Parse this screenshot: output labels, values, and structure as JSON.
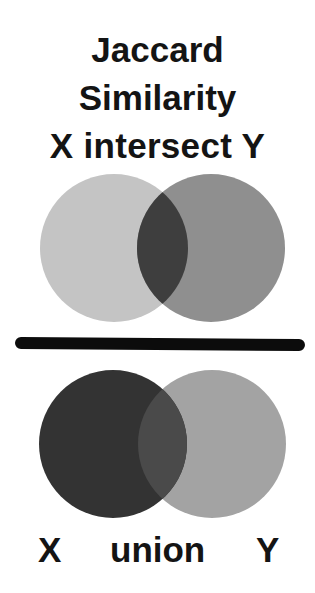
{
  "title": {
    "line1": "Jaccard",
    "line2": "Similarity",
    "line3": "X intersect Y"
  },
  "intersection_diagram": {
    "set_x": {
      "cx": 114,
      "cy": 248,
      "r": 74,
      "color": "#c4c4c4"
    },
    "set_y": {
      "cx": 211,
      "cy": 248,
      "r": 74,
      "color": "#8f8f8f"
    },
    "intersection_color": "#3e3e3e"
  },
  "separator": {
    "meaning": "fraction bar (divided by)",
    "color": "#0c0c0c"
  },
  "union_diagram": {
    "set_x": {
      "cx": 113,
      "cy": 444,
      "r": 74,
      "color": "#333333"
    },
    "set_y": {
      "cx": 212,
      "cy": 444,
      "r": 74,
      "color": "#a3a3a3"
    },
    "overlap_color": "#4a4a4a"
  },
  "union_label": {
    "x": "X",
    "word": "union",
    "y": "Y"
  }
}
